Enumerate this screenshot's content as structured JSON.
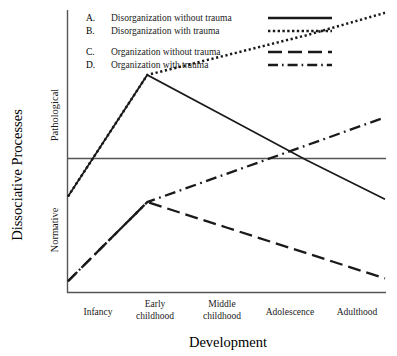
{
  "chart_data": {
    "type": "line",
    "title": "",
    "xlabel": "Development",
    "ylabel": "Dissociative Processes",
    "ylabel_top": "Pathological",
    "ylabel_bottom": "Normative",
    "categories": [
      "Infancy",
      "Early childhood",
      "Middle childhood",
      "Adolescence",
      "Adulthood"
    ],
    "grid": false,
    "legend_position": "top",
    "ylim": [
      0,
      100
    ],
    "axis_midline": 50,
    "series": [
      {
        "key": "A.",
        "name": "Disorganization without trauma",
        "style": "solid",
        "values": [
          34,
          77,
          62,
          47,
          33
        ]
      },
      {
        "key": "B.",
        "name": "Disorganization with trauma",
        "style": "dotted",
        "values": [
          34,
          77,
          84,
          91,
          99
        ]
      },
      {
        "key": "C.",
        "name": "Organization without trauma",
        "style": "dashed",
        "values": [
          4,
          32,
          23,
          14,
          5
        ]
      },
      {
        "key": "D.",
        "name": "Organization with trauma",
        "style": "dash-dot",
        "values": [
          4,
          32,
          42,
          52,
          62
        ]
      }
    ],
    "colors": {
      "line": "#1a1a1a",
      "axis": "#555555",
      "text": "#1a1a1a"
    }
  },
  "legend": {
    "rows": [
      {
        "key": "A.",
        "label": "Disorganization without trauma",
        "style": "solid"
      },
      {
        "key": "B.",
        "label": "Disorganization with trauma",
        "style": "dotted"
      },
      {
        "key": "C.",
        "label": "Organization without trauma",
        "style": "dashed"
      },
      {
        "key": "D.",
        "label": "Organization with trauma",
        "style": "dash-dot"
      }
    ]
  },
  "axes": {
    "x_title": "Development",
    "y_title": "Dissociative Processes",
    "y_upper_region": "Pathological",
    "y_lower_region": "Normative",
    "x_ticks": [
      {
        "line1": "Infancy",
        "line2": ""
      },
      {
        "line1": "Early",
        "line2": "childhood"
      },
      {
        "line1": "Middle",
        "line2": "childhood"
      },
      {
        "line1": "Adolescence",
        "line2": ""
      },
      {
        "line1": "Adulthood",
        "line2": ""
      }
    ]
  }
}
